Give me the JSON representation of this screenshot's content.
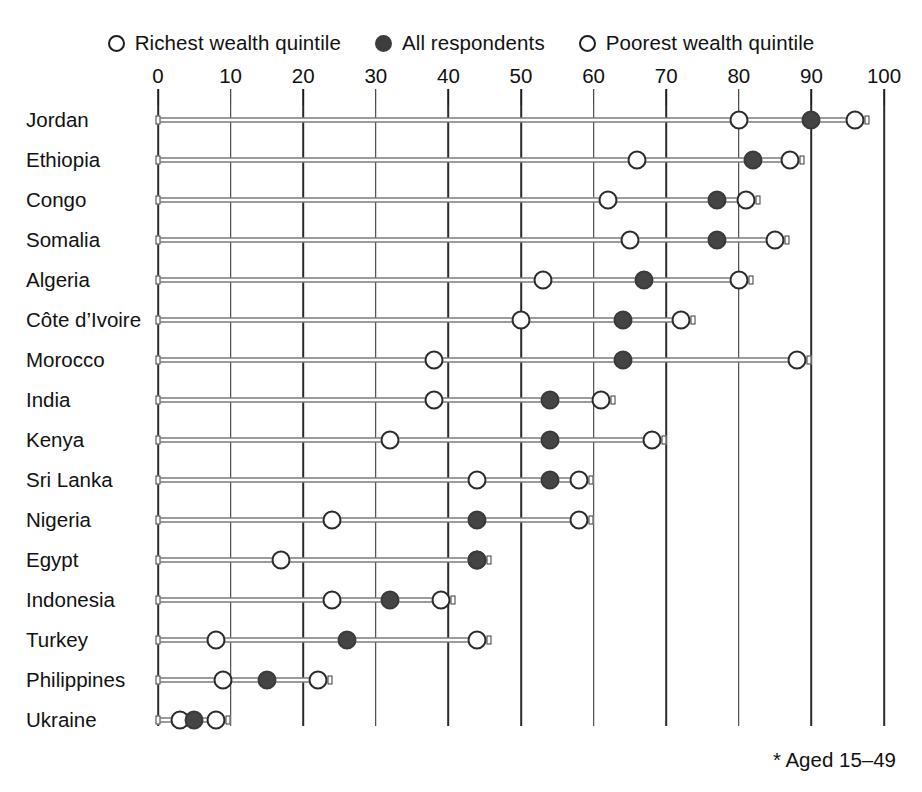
{
  "legend": {
    "items": [
      {
        "label": "Richest wealth quintile",
        "marker": "open-circle-icon",
        "key": "richest"
      },
      {
        "label": "All respondents",
        "marker": "filled-circle-icon",
        "key": "all"
      },
      {
        "label": "Poorest wealth quintile",
        "marker": "open-circle-icon",
        "key": "poorest"
      }
    ]
  },
  "footnote": "* Aged 15–49",
  "colors": {
    "filled_marker": "#444444",
    "open_marker_border": "#2a2a2a",
    "open_marker_fill": "#ffffff",
    "gridline": "#2a2a2a",
    "rowline": "#3a3a3a",
    "text": "#111111",
    "background": "#ffffff"
  },
  "chart_data": {
    "type": "scatter",
    "title": "",
    "xlabel": "",
    "ylabel": "",
    "xlim": [
      0,
      100
    ],
    "ylim": null,
    "grid": true,
    "legend_position": "top-center",
    "xticks": [
      0,
      10,
      20,
      30,
      40,
      50,
      60,
      70,
      80,
      90,
      100
    ],
    "xticklabels": [
      "0",
      "10",
      "20",
      "30",
      "40",
      "50",
      "60",
      "70",
      "80",
      "90",
      "100"
    ],
    "categories": [
      "Jordan",
      "Ethiopia",
      "Congo",
      "Somalia",
      "Algeria",
      "Côte d’Ivoire",
      "Morocco",
      "India",
      "Kenya",
      "Sri Lanka",
      "Nigeria",
      "Egypt",
      "Indonesia",
      "Turkey",
      "Philippines",
      "Ukraine"
    ],
    "series": [
      {
        "name": "Richest wealth quintile",
        "marker": "open-circle",
        "values": [
          96,
          87,
          81,
          85,
          80,
          72,
          88,
          61,
          68,
          44,
          58,
          17,
          39,
          8,
          9,
          3
        ]
      },
      {
        "name": "All respondents",
        "marker": "filled-circle",
        "values": [
          90,
          82,
          77,
          77,
          67,
          64,
          64,
          54,
          54,
          54,
          44,
          44,
          32,
          26,
          15,
          5
        ]
      },
      {
        "name": "Poorest wealth quintile",
        "marker": "open-circle",
        "values": [
          80,
          66,
          62,
          65,
          53,
          50,
          38,
          38,
          32,
          58,
          24,
          44,
          24,
          44,
          22,
          8
        ]
      }
    ],
    "annotations": [
      "* Aged 15–49"
    ]
  }
}
